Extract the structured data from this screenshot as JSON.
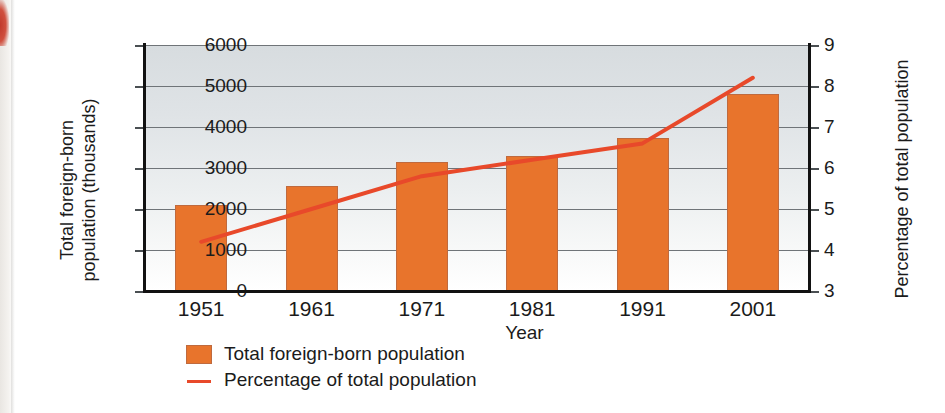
{
  "chart_data": {
    "type": "bar",
    "title": "",
    "xlabel": "Year",
    "categories": [
      "1951",
      "1961",
      "1971",
      "1981",
      "1991",
      "2001"
    ],
    "grid": true,
    "legend_position": "bottom-left",
    "series": [
      {
        "name": "Total foreign-born population",
        "type": "bar",
        "axis": "left",
        "color": "#e8742c",
        "values": [
          2100,
          2550,
          3150,
          3300,
          3720,
          4800
        ]
      },
      {
        "name": "Percentage of total population",
        "type": "line",
        "axis": "right",
        "color": "#e8492a",
        "values": [
          4.2,
          5.0,
          5.8,
          6.2,
          6.6,
          8.2
        ]
      }
    ],
    "axes": {
      "left": {
        "label_line1": "Total foreign-born",
        "label_line2": "population (thousands)",
        "ticks": [
          "6000",
          "5000",
          "4000",
          "3000",
          "2000",
          "1000",
          "0"
        ],
        "tick_values": [
          6000,
          5000,
          4000,
          3000,
          2000,
          1000,
          0
        ],
        "ylim": [
          0,
          6000
        ]
      },
      "right": {
        "label": "Percentage of total population",
        "ticks": [
          "9",
          "8",
          "7",
          "6",
          "5",
          "4",
          "3"
        ],
        "tick_values": [
          9,
          8,
          7,
          6,
          5,
          4,
          3
        ],
        "ylim": [
          3,
          9
        ]
      }
    },
    "legend": [
      {
        "label": "Total foreign-born population",
        "marker": "square-swatch",
        "color": "#e8742c"
      },
      {
        "label": "Percentage of total population",
        "marker": "line-swatch",
        "color": "#e8492a"
      }
    ]
  }
}
